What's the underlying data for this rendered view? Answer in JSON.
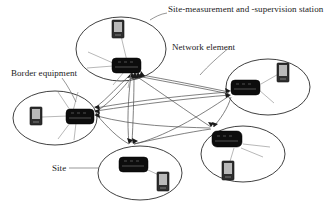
{
  "diagram": {
    "type": "network-topology",
    "title_visible": false,
    "background_color": "#ffffff",
    "line_color": "#4a4a4a",
    "node_color": "#0d0d0d",
    "station_color": "#2e2e2e",
    "labels": [
      {
        "id": "station",
        "text": "Site-measurement and -supervision station",
        "points_to": "measurement-station-top"
      },
      {
        "id": "network_element",
        "text": "Network element",
        "points_to": "router-right"
      },
      {
        "id": "border_equipment",
        "text": "Border equipment",
        "points_to": "router-left"
      },
      {
        "id": "site",
        "text": "Site",
        "points_to": "site-ellipse-bottom-center"
      }
    ],
    "sites": [
      {
        "id": "site-top",
        "name": "Site top",
        "router": "network-element",
        "station": "site-measurement-and-supervision-station"
      },
      {
        "id": "site-left",
        "name": "Site left",
        "router": "border-equipment",
        "station": "site-measurement-and-supervision-station"
      },
      {
        "id": "site-right",
        "name": "Site right",
        "router": "network-element",
        "station": "site-measurement-and-supervision-station"
      },
      {
        "id": "site-bottom-center",
        "name": "Site bottom center",
        "router": "network-element",
        "station": "site-measurement-and-supervision-station"
      },
      {
        "id": "site-bottom-right",
        "name": "Site bottom right",
        "router": "network-element",
        "station": "site-measurement-and-supervision-station"
      }
    ],
    "connections": [
      {
        "from": "site-top",
        "to": "site-left"
      },
      {
        "from": "site-top",
        "to": "site-right"
      },
      {
        "from": "site-top",
        "to": "site-bottom-center"
      },
      {
        "from": "site-top",
        "to": "site-bottom-right"
      },
      {
        "from": "site-left",
        "to": "site-right"
      },
      {
        "from": "site-left",
        "to": "site-bottom-center"
      },
      {
        "from": "site-left",
        "to": "site-bottom-right"
      },
      {
        "from": "site-right",
        "to": "site-bottom-center"
      },
      {
        "from": "site-right",
        "to": "site-bottom-right"
      },
      {
        "from": "site-bottom-center",
        "to": "site-bottom-right"
      }
    ]
  }
}
